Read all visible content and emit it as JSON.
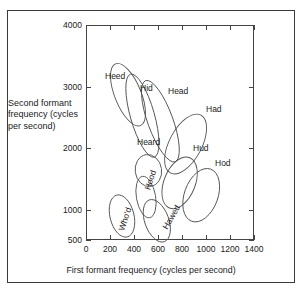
{
  "figure": {
    "caption_x": "First formant frequency (cycles per second)",
    "caption_y": "Second formant frequency (cycles per second)"
  },
  "chart_data": {
    "type": "scatter",
    "title": "",
    "xlabel": "First formant frequency (cycles per second)",
    "ylabel": "Second formant frequency (cycles per second)",
    "xlim": [
      0,
      1400
    ],
    "ylim": [
      500,
      4000
    ],
    "xticks": [
      0,
      200,
      400,
      600,
      800,
      1000,
      1200,
      1400
    ],
    "yticks": [
      500,
      1000,
      2000,
      3000,
      4000
    ],
    "grid": false,
    "legend": "none",
    "note": "Vowel formant dispersion ellipses; y-axis spacing is non-linear between 500 and 1000",
    "ellipses": [
      {
        "label": "Heed",
        "cx": 350,
        "cy": 2870,
        "rx": 110,
        "ry": 540,
        "angle": -22
      },
      {
        "label": "Hid",
        "cx": 470,
        "cy": 2530,
        "rx": 100,
        "ry": 700,
        "angle": -16
      },
      {
        "label": "Head",
        "cx": 620,
        "cy": 2440,
        "rx": 105,
        "ry": 700,
        "angle": -20
      },
      {
        "label": "Had",
        "cx": 830,
        "cy": 2070,
        "rx": 135,
        "ry": 530,
        "angle": 28
      },
      {
        "label": "Heard",
        "cx": 520,
        "cy": 1640,
        "rx": 110,
        "ry": 260,
        "angle": -8
      },
      {
        "label": "Hud",
        "cx": 780,
        "cy": 1440,
        "rx": 130,
        "ry": 440,
        "angle": 22
      },
      {
        "label": "Hod",
        "cx": 960,
        "cy": 1240,
        "rx": 140,
        "ry": 450,
        "angle": 20
      },
      {
        "label": "Hood",
        "cx": 500,
        "cy": 1210,
        "rx": 80,
        "ry": 340,
        "angle": -10
      },
      {
        "label": "Who'd",
        "cx": 300,
        "cy": 900,
        "rx": 100,
        "ry": 350,
        "angle": -14
      },
      {
        "label": "Hawed",
        "cx": 590,
        "cy": 820,
        "rx": 100,
        "ry": 360,
        "angle": -20
      }
    ],
    "labels": [
      {
        "text": "Heed",
        "x": 105,
        "y": 71,
        "rot": 0
      },
      {
        "text": "Hid",
        "x": 140,
        "y": 83,
        "rot": 0
      },
      {
        "text": "Head",
        "x": 168,
        "y": 86,
        "rot": 0
      },
      {
        "text": "Had",
        "x": 206,
        "y": 104,
        "rot": 0
      },
      {
        "text": "Heard",
        "x": 137,
        "y": 137,
        "rot": 0
      },
      {
        "text": "Hud",
        "x": 193,
        "y": 143,
        "rot": 0
      },
      {
        "text": "Hod",
        "x": 215,
        "y": 158,
        "rot": 0
      },
      {
        "text": "Hood",
        "x": 140,
        "y": 175,
        "rot": -72
      },
      {
        "text": "Who'd",
        "x": 113,
        "y": 214,
        "rot": -72
      },
      {
        "text": "Hawed",
        "x": 158,
        "y": 212,
        "rot": -60
      }
    ]
  }
}
